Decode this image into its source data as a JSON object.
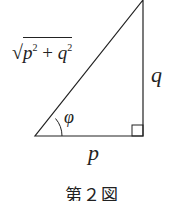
{
  "figure": {
    "caption": "第２図",
    "hypotenuse_label": {
      "radical": "√",
      "base1": "p",
      "exp1": "2",
      "op": " + ",
      "base2": "q",
      "exp2": "2"
    },
    "vertical_side_label": "q",
    "horizontal_side_label": "p",
    "angle_label": "φ",
    "right_angle_marker": true
  }
}
